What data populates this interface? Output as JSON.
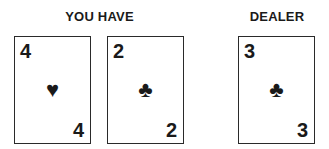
{
  "player": {
    "label": "YOU HAVE",
    "cards": [
      {
        "rank": "4",
        "suit": "hearts",
        "suit_glyph": "♥"
      },
      {
        "rank": "2",
        "suit": "clubs",
        "suit_glyph": "♣"
      }
    ]
  },
  "dealer": {
    "label": "DEALER",
    "cards": [
      {
        "rank": "3",
        "suit": "clubs",
        "suit_glyph": "♣"
      }
    ]
  }
}
